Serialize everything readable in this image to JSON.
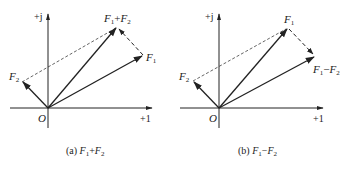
{
  "figure": {
    "panels": [
      {
        "id": "a",
        "caption_prefix": "(a) ",
        "caption_expr": "F1+F2",
        "axis_x_label": "+1",
        "axis_y_label": "+j",
        "origin_label": "O",
        "vectors": [
          {
            "name": "F1",
            "label": "F1"
          },
          {
            "name": "F2",
            "label": "F2"
          },
          {
            "name": "F1+F2",
            "label": "F1+F2"
          }
        ]
      },
      {
        "id": "b",
        "caption_prefix": "(b) ",
        "caption_expr": "F1−F2",
        "axis_x_label": "+1",
        "axis_y_label": "+j",
        "origin_label": "O",
        "vectors": [
          {
            "name": "F1",
            "label": "F1"
          },
          {
            "name": "F2",
            "label": "F2"
          },
          {
            "name": "F1-F2",
            "label": "F1−F2"
          }
        ]
      }
    ],
    "colors": {
      "line": "#222222",
      "background": "#ffffff"
    }
  }
}
